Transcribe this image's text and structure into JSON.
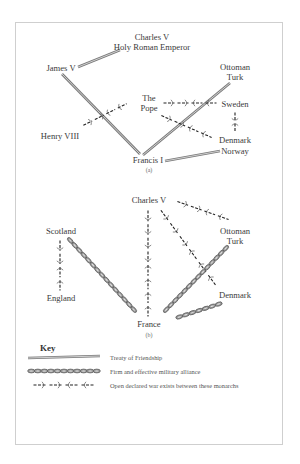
{
  "diagram_a": {
    "caption": "(a)",
    "nodes": {
      "charles_v": [
        "Charles V",
        "Holy Roman Emperor"
      ],
      "james_v": [
        "James V"
      ],
      "ottoman_turk": [
        "Ottoman",
        "Turk"
      ],
      "the_pope": [
        "The",
        "Pope"
      ],
      "sweden": [
        "Sweden"
      ],
      "henry_viii": [
        "Henry VIII"
      ],
      "denmark_norway": [
        "Denmark",
        "Norway"
      ],
      "francis_i": [
        "Francis I"
      ]
    },
    "relations": [
      {
        "from": "Charles V",
        "to": "James V",
        "type": "treaty"
      },
      {
        "from": "James V",
        "to": "Francis I",
        "type": "treaty"
      },
      {
        "from": "Ottoman Turk",
        "to": "Francis I",
        "type": "treaty"
      },
      {
        "from": "Francis I",
        "to": "Denmark Norway",
        "type": "treaty"
      },
      {
        "from": "Henry VIII",
        "to": "The Pope",
        "type": "war"
      },
      {
        "from": "The Pope",
        "to": "Sweden",
        "type": "war"
      },
      {
        "from": "The Pope",
        "to": "Denmark Norway",
        "type": "war"
      },
      {
        "from": "Sweden",
        "to": "Denmark Norway",
        "type": "war"
      }
    ]
  },
  "diagram_b": {
    "caption": "(b)",
    "nodes": {
      "charles_v": [
        "Charles V"
      ],
      "scotland": [
        "Scotland"
      ],
      "ottoman_turk": [
        "Ottoman",
        "Turk"
      ],
      "england": [
        "England"
      ],
      "denmark": [
        "Denmark"
      ],
      "france": [
        "France"
      ]
    },
    "relations": [
      {
        "from": "Scotland",
        "to": "England",
        "type": "war"
      },
      {
        "from": "Scotland",
        "to": "France",
        "type": "alliance"
      },
      {
        "from": "Charles V",
        "to": "France",
        "type": "war"
      },
      {
        "from": "Charles V",
        "to": "Ottoman Turk",
        "type": "war"
      },
      {
        "from": "Charles V",
        "to": "Denmark",
        "type": "war"
      },
      {
        "from": "Ottoman Turk",
        "to": "France",
        "type": "alliance"
      },
      {
        "from": "Denmark",
        "to": "France",
        "type": "alliance"
      }
    ]
  },
  "key": {
    "title": "Key",
    "items": [
      {
        "type": "treaty",
        "label": "Treaty of Friendship"
      },
      {
        "type": "alliance",
        "label": "Firm and effective military alliance"
      },
      {
        "type": "war",
        "label": "Open declared war exists between these monarchs"
      }
    ]
  }
}
